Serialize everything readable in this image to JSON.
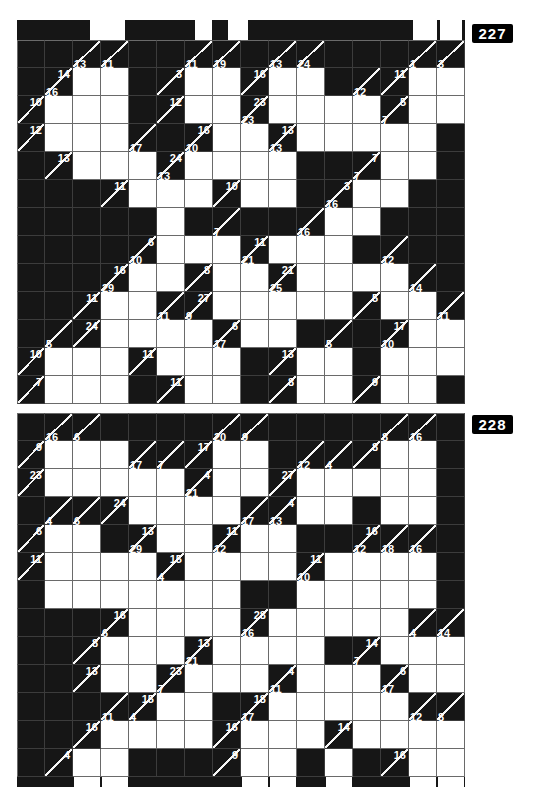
{
  "page": {
    "width": 536,
    "height": 787,
    "background": "#ffffff"
  },
  "colors": {
    "black_cell": "#161616",
    "grid_line": "#6a6a6a",
    "clue_diagonal": "#f5f5f5",
    "clue_text": "#ffffff",
    "label_bg": "#000000",
    "label_text": "#ffffff"
  },
  "layout": {
    "cell_px": 28,
    "grid_left": 17,
    "cols": 16,
    "rows": 13
  },
  "puzzles": [
    {
      "label": "227",
      "top": 20,
      "label_top_offset": 4,
      "clipped_top_row": {
        "height": 20,
        "notches_px": [
          [
            73,
            35
          ],
          [
            178,
            17
          ],
          [
            211,
            20
          ],
          [
            396,
            24
          ],
          [
            423,
            22
          ]
        ]
      },
      "clipped_bottom_row": null,
      "rows": [
        [
          "b",
          "b",
          "|13",
          "|11",
          "b",
          "b",
          "|11",
          "|19",
          "b",
          "|13",
          "|24",
          "b",
          "b",
          "b",
          "|1",
          "|3"
        ],
        [
          "b",
          "14|16",
          "w",
          "w",
          "b",
          "3|",
          "w",
          "w",
          "16|",
          "w",
          "w",
          "b",
          "|12",
          "11|",
          "w",
          "w"
        ],
        [
          "10|",
          "w",
          "w",
          "w",
          "b",
          "12|",
          "w",
          "w",
          "23|23",
          "w",
          "w",
          "w",
          "w",
          "5|7",
          "w",
          "w"
        ],
        [
          "12|",
          "w",
          "w",
          "w",
          "|17",
          "b",
          "16|10",
          "w",
          "w",
          "13|13",
          "w",
          "w",
          "w",
          "w",
          "w",
          "b"
        ],
        [
          "b",
          "13|",
          "w",
          "w",
          "w",
          "24|13",
          "w",
          "w",
          "w",
          "w",
          "b",
          "b",
          "7|7",
          "w",
          "w",
          "b"
        ],
        [
          "b",
          "b",
          "b",
          "11|",
          "w",
          "w",
          "w",
          "10|",
          "w",
          "w",
          "b",
          "3|16",
          "w",
          "w",
          "b",
          "b"
        ],
        [
          "b",
          "b",
          "b",
          "b",
          "b",
          "w",
          "b",
          "|7",
          "b",
          "b",
          "|16",
          "w",
          "w",
          "b",
          "b",
          "b"
        ],
        [
          "b",
          "b",
          "b",
          "b",
          "6|10",
          "w",
          "w",
          "w",
          "11|21",
          "w",
          "w",
          "w",
          "b",
          "|12",
          "b",
          "b"
        ],
        [
          "b",
          "b",
          "b",
          "16|29",
          "w",
          "w",
          "8|",
          "w",
          "w",
          "21|25",
          "w",
          "w",
          "w",
          "w",
          "|14",
          "b"
        ],
        [
          "b",
          "b",
          "11|",
          "w",
          "w",
          "|11",
          "27|9",
          "w",
          "w",
          "w",
          "w",
          "w",
          "5|",
          "w",
          "w",
          "|11"
        ],
        [
          "b",
          "|5",
          "24|",
          "w",
          "w",
          "w",
          "w",
          "6|17",
          "w",
          "w",
          "b",
          "|5",
          "b",
          "17|10",
          "w",
          "w"
        ],
        [
          "10|",
          "w",
          "w",
          "w",
          "11|",
          "w",
          "w",
          "w",
          "b",
          "13|",
          "w",
          "w",
          "b",
          "w",
          "w",
          "w"
        ],
        [
          "7|",
          "w",
          "w",
          "w",
          "b",
          "11|",
          "w",
          "w",
          "b",
          "8|",
          "w",
          "w",
          "9|",
          "w",
          "w",
          "b"
        ]
      ]
    },
    {
      "label": "228",
      "top": 413,
      "label_top_offset": 2,
      "clipped_top_row": null,
      "clipped_bottom_row": {
        "height": 10,
        "notch_cols": [
          3,
          4,
          9,
          10,
          12,
          15,
          16
        ]
      },
      "rows": [
        [
          "b",
          "|16",
          "|6",
          "b",
          "b",
          "b",
          "b",
          "|20",
          "|9",
          "b",
          "b",
          "b",
          "b",
          "|8",
          "|16",
          "b"
        ],
        [
          "9|",
          "w",
          "w",
          "w",
          "|17",
          "|7",
          "17|",
          "w",
          "w",
          "b",
          "|12",
          "|4",
          "8|",
          "w",
          "w",
          "b"
        ],
        [
          "23|",
          "w",
          "w",
          "w",
          "w",
          "w",
          "4|21",
          "w",
          "w",
          "27|",
          "w",
          "w",
          "w",
          "w",
          "w",
          "b"
        ],
        [
          "b",
          "|4",
          "|6",
          "24|",
          "w",
          "w",
          "w",
          "w",
          "|17",
          "4|13",
          "w",
          "w",
          "b",
          "w",
          "w",
          "b"
        ],
        [
          "6|",
          "w",
          "w",
          "b",
          "13|29",
          "w",
          "w",
          "11|12",
          "w",
          "w",
          "b",
          "b",
          "16|12",
          "|18",
          "|16",
          "b"
        ],
        [
          "11|",
          "w",
          "w",
          "w",
          "w",
          "15|4",
          "w",
          "w",
          "w",
          "w",
          "11|10",
          "w",
          "w",
          "w",
          "w",
          "b"
        ],
        [
          "b",
          "w",
          "w",
          "w",
          "w",
          "w",
          "w",
          "w",
          "b",
          "b",
          "w",
          "w",
          "w",
          "w",
          "w",
          "b"
        ],
        [
          "b",
          "b",
          "b",
          "16|6",
          "w",
          "w",
          "w",
          "w",
          "28|16",
          "w",
          "w",
          "w",
          "w",
          "w",
          "|4",
          "|14"
        ],
        [
          "b",
          "b",
          "8|",
          "w",
          "w",
          "w",
          "13|21",
          "w",
          "w",
          "w",
          "w",
          "b",
          "14|7",
          "w",
          "w",
          "w"
        ],
        [
          "b",
          "b",
          "13|",
          "w",
          "w",
          "23|7",
          "w",
          "w",
          "w",
          "4|11",
          "w",
          "w",
          "w",
          "6|17",
          "w",
          "w"
        ],
        [
          "b",
          "b",
          "b",
          "|11",
          "15|4",
          "w",
          "w",
          "b",
          "18|17",
          "w",
          "w",
          "w",
          "w",
          "w",
          "|12",
          "|8"
        ],
        [
          "b",
          "b",
          "16|",
          "w",
          "w",
          "w",
          "w",
          "16|",
          "w",
          "w",
          "w",
          "14|",
          "w",
          "w",
          "w",
          "w"
        ],
        [
          "b",
          "4|",
          "w",
          "w",
          "b",
          "b",
          "b",
          "9|",
          "w",
          "w",
          "b",
          "w",
          "b",
          "16|",
          "w",
          "w"
        ]
      ]
    }
  ]
}
